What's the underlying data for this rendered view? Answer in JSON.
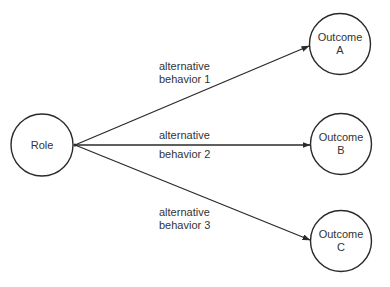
{
  "diagram": {
    "type": "flow",
    "colors": {
      "stroke": "#2a2a2a",
      "text": "#333333",
      "background": "#ffffff"
    },
    "source": {
      "id": "role",
      "label": "Role"
    },
    "outcomes": [
      {
        "id": "outcome-a",
        "line1": "Outcome",
        "line2": "A"
      },
      {
        "id": "outcome-b",
        "line1": "Outcome",
        "line2": "B"
      },
      {
        "id": "outcome-c",
        "line1": "Outcome",
        "line2": "C"
      }
    ],
    "edges": [
      {
        "from": "role",
        "to": "outcome-a",
        "line1": "alternative",
        "line2": "behavior 1"
      },
      {
        "from": "role",
        "to": "outcome-b",
        "line1": "alternative",
        "line2": "behavior 2"
      },
      {
        "from": "role",
        "to": "outcome-c",
        "line1": "alternative",
        "line2": "behavior 3"
      }
    ]
  }
}
